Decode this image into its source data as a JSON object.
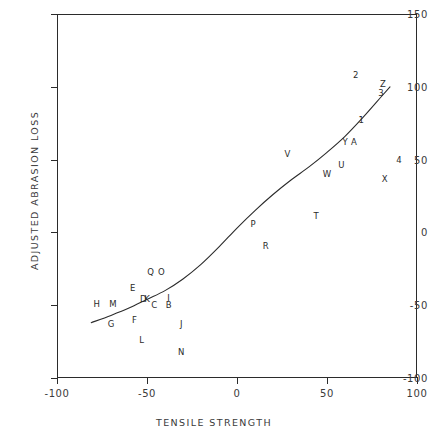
{
  "chart_data": {
    "type": "scatter",
    "title": "",
    "xlabel": "TENSILE STRENGTH",
    "ylabel": "ADJUSTED ABRASION LOSS",
    "xlim": [
      -100,
      100
    ],
    "ylim": [
      -100,
      150
    ],
    "xticks": [
      "-100",
      "-50",
      "0",
      "50",
      "100"
    ],
    "xtick_values": [
      -100,
      -50,
      0,
      50,
      100
    ],
    "yticks": [
      "-100",
      "-50",
      "0",
      "50",
      "100",
      "150"
    ],
    "ytick_values": [
      -100,
      -50,
      0,
      50,
      100,
      150
    ],
    "grid": false,
    "legend": false,
    "marker_style": "letter-label",
    "points": [
      {
        "label": "H",
        "x": -78,
        "y": -49
      },
      {
        "label": "M",
        "x": -69,
        "y": -49
      },
      {
        "label": "G",
        "x": -70,
        "y": -63
      },
      {
        "label": "E",
        "x": -58,
        "y": -38
      },
      {
        "label": "F",
        "x": -57,
        "y": -60
      },
      {
        "label": "D",
        "x": -52,
        "y": -46
      },
      {
        "label": "K",
        "x": -50,
        "y": -46
      },
      {
        "label": "C",
        "x": -46,
        "y": -50
      },
      {
        "label": "L",
        "x": -53,
        "y": -74
      },
      {
        "label": "Q",
        "x": -48,
        "y": -27
      },
      {
        "label": "O",
        "x": -42,
        "y": -27
      },
      {
        "label": "B",
        "x": -38,
        "y": -50
      },
      {
        "label": "I",
        "x": -38,
        "y": -45
      },
      {
        "label": "J",
        "x": -31,
        "y": -63
      },
      {
        "label": "N",
        "x": -31,
        "y": -82
      },
      {
        "label": "P",
        "x": 9,
        "y": 6
      },
      {
        "label": "R",
        "x": 16,
        "y": -9
      },
      {
        "label": "V",
        "x": 28,
        "y": 54
      },
      {
        "label": "W",
        "x": 50,
        "y": 40
      },
      {
        "label": "T",
        "x": 44,
        "y": 11
      },
      {
        "label": "U",
        "x": 58,
        "y": 46
      },
      {
        "label": "Y",
        "x": 60,
        "y": 62
      },
      {
        "label": "A",
        "x": 65,
        "y": 62
      },
      {
        "label": "1",
        "x": 69,
        "y": 77
      },
      {
        "label": "2",
        "x": 66,
        "y": 108
      },
      {
        "label": "Z",
        "x": 81,
        "y": 102
      },
      {
        "label": "3",
        "x": 80,
        "y": 96
      },
      {
        "label": "4",
        "x": 90,
        "y": 50
      },
      {
        "label": "X",
        "x": 82,
        "y": 37
      }
    ],
    "fit_curve": {
      "name": "smooth-fit",
      "description": "monotone increasing smoothed curve through the point cloud",
      "points": [
        {
          "x": -81,
          "y": -62
        },
        {
          "x": -70,
          "y": -57
        },
        {
          "x": -60,
          "y": -52
        },
        {
          "x": -50,
          "y": -46
        },
        {
          "x": -40,
          "y": -40
        },
        {
          "x": -30,
          "y": -32
        },
        {
          "x": -20,
          "y": -22
        },
        {
          "x": -10,
          "y": -10
        },
        {
          "x": 0,
          "y": 3
        },
        {
          "x": 10,
          "y": 15
        },
        {
          "x": 20,
          "y": 26
        },
        {
          "x": 30,
          "y": 36
        },
        {
          "x": 40,
          "y": 45
        },
        {
          "x": 50,
          "y": 55
        },
        {
          "x": 60,
          "y": 66
        },
        {
          "x": 70,
          "y": 79
        },
        {
          "x": 80,
          "y": 93
        },
        {
          "x": 85,
          "y": 100
        }
      ]
    }
  }
}
